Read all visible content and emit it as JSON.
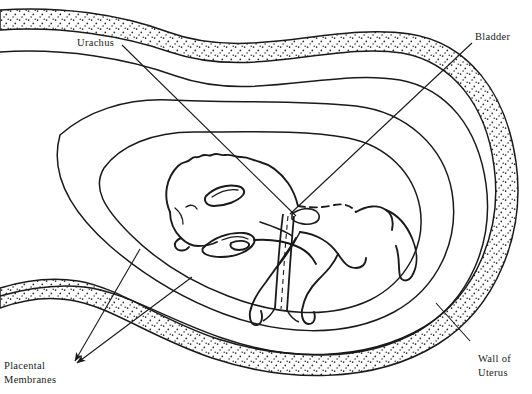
{
  "figure": {
    "background_color": "#ffffff",
    "line_color": "#1a1a1a",
    "stipple_color": "#2b2b2b",
    "width": 532,
    "height": 394
  },
  "labels": {
    "urachus": "Urachus",
    "bladder": "Bladder",
    "placental_line1": "Placental",
    "placental_line2": "Membranes",
    "wall_line1": "Wall of",
    "wall_line2": "Uterus"
  },
  "structures": {
    "uterine_wall": "stippled outer band",
    "placental_membranes": "two concentric membrane layers",
    "amnion": "inner membrane layer",
    "fetus": "curled fetal foal with head, ear, eye, muzzle, forelimbs and hindlimbs",
    "urachus_tube": "narrow tube with dashed lumen running from bladder to membrane attachment"
  }
}
